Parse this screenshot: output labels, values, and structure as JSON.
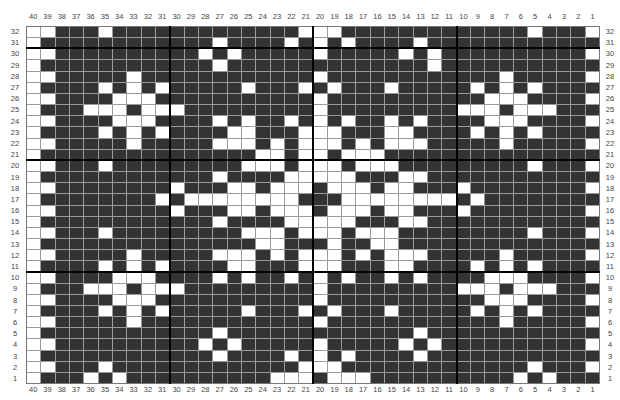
{
  "chart": {
    "title": "",
    "columns": 40,
    "rows": 32,
    "column_labels_order": "40 to 1 (left to right)",
    "row_labels_order": "32 to 1 (top to bottom)",
    "legend": {
      "1": "white / contrast stitch",
      "0": "dark / main color stitch"
    },
    "colors": {
      "dark": "#333333",
      "light": "#ffffff",
      "gridline": "#9a9a9a",
      "major_line": "#000000"
    },
    "major_lines_every": 10,
    "grid_rows": [
      {
        "row": 32,
        "cells": "1100010000000000000111000000000000010001"
      },
      {
        "row": 31,
        "cells": "1000000000000100001010100001000000000000"
      },
      {
        "row": 30,
        "cells": "1100000000001010000010000010100000000001"
      },
      {
        "row": 29,
        "cells": "1000000000000100000000000000100000000000"
      },
      {
        "row": 28,
        "cells": "1100000100000000000010000000000001000001"
      },
      {
        "row": 27,
        "cells": "1000010101000001000101000100000101010000"
      },
      {
        "row": 26,
        "cells": "1100001110000000000010000000000011100001"
      },
      {
        "row": 25,
        "cells": "1000111011100000000010000000001110111000"
      },
      {
        "row": 24,
        "cells": "1100001110000101001010100101000011100001"
      },
      {
        "row": 23,
        "cells": "1000010101000011000111000110000101010000"
      },
      {
        "row": 22,
        "cells": "1100000100000111010111010111000001000001"
      },
      {
        "row": 21,
        "cells": "1000000000000000110110111000000000000000"
      },
      {
        "row": 20,
        "cells": "1100010000000001110111011100000000010001"
      },
      {
        "row": 19,
        "cells": "1000000000000100001111100011000000000000"
      },
      {
        "row": 18,
        "cells": "1100000000100011011101110110001000000001"
      },
      {
        "row": 17,
        "cells": "1000000001011111111000111111110100000000"
      },
      {
        "row": 16,
        "cells": "1100000000100011011101110110001000000001"
      },
      {
        "row": 15,
        "cells": "1000000000000100001111100011000000000000"
      },
      {
        "row": 14,
        "cells": "1100010000000001110111011100000000010001"
      },
      {
        "row": 13,
        "cells": "1000000000000000110001001100000000000000"
      },
      {
        "row": 12,
        "cells": "1100000100000111010111010111000001000001"
      },
      {
        "row": 11,
        "cells": "1000010101000011000111000110000101010000"
      },
      {
        "row": 10,
        "cells": "1100001110000101001010100101000011100001"
      },
      {
        "row": 9,
        "cells": "1000111011100000000010000000001110111000"
      },
      {
        "row": 8,
        "cells": "1100001110000000000010000000000011100001"
      },
      {
        "row": 7,
        "cells": "1000010101000001000101000100000101010000"
      },
      {
        "row": 6,
        "cells": "1100000100000000000010000000000001000001"
      },
      {
        "row": 5,
        "cells": "1000000000000100000000000001000000000000"
      },
      {
        "row": 4,
        "cells": "1100000000001010000010000010100000000001"
      },
      {
        "row": 3,
        "cells": "1000000000000100001010100001000000000000"
      },
      {
        "row": 2,
        "cells": "1100010000000000000111000000000000010001"
      },
      {
        "row": 1,
        "cells": "1000101000000000011101110000000000101000"
      }
    ]
  }
}
